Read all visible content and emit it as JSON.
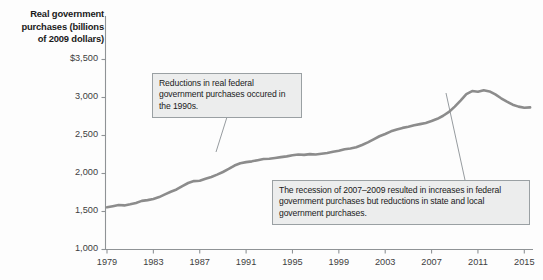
{
  "chart_data": {
    "type": "line",
    "title": "",
    "ylabel": "Real government purchases (billions of 2009 dollars)",
    "xlabel": "",
    "ylim": [
      1000,
      3500
    ],
    "xlim": [
      1979,
      2015.75
    ],
    "grid": false,
    "legend": null,
    "y_ticks": [
      {
        "value": 3500,
        "label": "$3,500"
      },
      {
        "value": 3000,
        "label": "3,000"
      },
      {
        "value": 2500,
        "label": "2,500"
      },
      {
        "value": 2000,
        "label": "2,000"
      },
      {
        "value": 1500,
        "label": "1,500"
      },
      {
        "value": 1000,
        "label": "1,000"
      }
    ],
    "x_ticks": [
      {
        "value": 1979,
        "label": "1979"
      },
      {
        "value": 1983,
        "label": "1983"
      },
      {
        "value": 1987,
        "label": "1987"
      },
      {
        "value": 1991,
        "label": "1991"
      },
      {
        "value": 1995,
        "label": "1995"
      },
      {
        "value": 1999,
        "label": "1999"
      },
      {
        "value": 2003,
        "label": "2003"
      },
      {
        "value": 2007,
        "label": "2007"
      },
      {
        "value": 2011,
        "label": "2011"
      },
      {
        "value": 2015,
        "label": "2015"
      }
    ],
    "series": [
      {
        "name": "Real government purchases",
        "color": "#8c8c8c",
        "x": [
          1979.0,
          1979.5,
          1980.0,
          1980.5,
          1981.0,
          1981.5,
          1982.0,
          1982.5,
          1983.0,
          1983.5,
          1984.0,
          1984.5,
          1985.0,
          1985.5,
          1986.0,
          1986.5,
          1987.0,
          1987.5,
          1988.0,
          1988.5,
          1989.0,
          1989.5,
          1990.0,
          1990.5,
          1991.0,
          1991.5,
          1992.0,
          1992.5,
          1993.0,
          1993.5,
          1994.0,
          1994.5,
          1995.0,
          1995.5,
          1996.0,
          1996.5,
          1997.0,
          1997.5,
          1998.0,
          1998.5,
          1999.0,
          1999.5,
          2000.0,
          2000.5,
          2001.0,
          2001.5,
          2002.0,
          2002.5,
          2003.0,
          2003.5,
          2004.0,
          2004.5,
          2005.0,
          2005.5,
          2006.0,
          2006.5,
          2007.0,
          2007.5,
          2008.0,
          2008.5,
          2009.0,
          2009.5,
          2010.0,
          2010.5,
          2011.0,
          2011.5,
          2012.0,
          2012.5,
          2013.0,
          2013.5,
          2014.0,
          2014.5,
          2015.0,
          2015.5
        ],
        "y": [
          1555,
          1570,
          1585,
          1580,
          1595,
          1612,
          1640,
          1650,
          1665,
          1690,
          1725,
          1760,
          1790,
          1835,
          1875,
          1900,
          1905,
          1930,
          1955,
          1985,
          2020,
          2060,
          2105,
          2135,
          2150,
          2160,
          2175,
          2190,
          2195,
          2205,
          2215,
          2225,
          2240,
          2250,
          2245,
          2255,
          2250,
          2260,
          2270,
          2285,
          2300,
          2320,
          2330,
          2345,
          2375,
          2410,
          2450,
          2490,
          2520,
          2555,
          2580,
          2600,
          2615,
          2635,
          2650,
          2665,
          2690,
          2720,
          2760,
          2810,
          2880,
          2960,
          3045,
          3085,
          3075,
          3095,
          3080,
          3040,
          2990,
          2945,
          2905,
          2880,
          2865,
          2870
        ]
      }
    ],
    "annotations": [
      {
        "id": "callout-1990s",
        "text": "Reductions in real federal government purchases occured in the 1990s.",
        "leader_from": [
          227,
          117
        ],
        "leader_to": [
          216,
          152
        ]
      },
      {
        "id": "callout-recession",
        "text": "The recession of 2007–2009 resulted in increases in federal government purchases but reductions in state and local government purchases.",
        "leader_from": [
          465,
          180
        ],
        "leader_to": [
          446,
          93
        ]
      }
    ]
  },
  "axis_title": {
    "line1": "Real government",
    "line2": "purchases (billions",
    "line3": "of 2009 dollars)"
  }
}
